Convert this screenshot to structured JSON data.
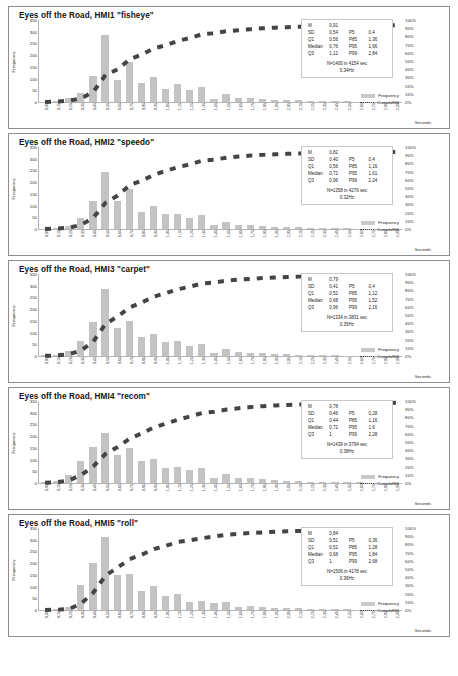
{
  "document": {
    "page_background": "#ffffff",
    "bar_color": "#c3c3c3",
    "line_color": "#444444"
  },
  "axes": {
    "y_label": "Frequency",
    "y_ticks": [
      "350",
      "300",
      "250",
      "200",
      "150",
      "100",
      "50",
      "0"
    ],
    "y_values": [
      350,
      300,
      250,
      200,
      150,
      100,
      50,
      0
    ],
    "y_max": 350,
    "y2_ticks": [
      "100%",
      "90%",
      "80%",
      "70%",
      "60%",
      "50%",
      "40%",
      "30%",
      "20%",
      "10%",
      "0%"
    ],
    "y2_values": [
      100,
      90,
      80,
      70,
      60,
      50,
      40,
      30,
      20,
      10,
      0
    ],
    "x_label": "Seconds",
    "x_ticks": [
      "0,05",
      "0,15",
      "0,25",
      "0,35",
      "0,45",
      "0,55",
      "0,65",
      "0,75",
      "0,85",
      "0,95",
      "1,05",
      "1,15",
      "1,25",
      "1,35",
      "1,45",
      "1,55",
      "1,65",
      "1,75",
      "1,85",
      "1,95",
      "2,05",
      "2,15",
      "2,25",
      "2,35",
      "2,45",
      "2,55",
      "2,65",
      "2,75",
      "2,85",
      "2,95"
    ]
  },
  "legend": {
    "frequency_label": "Frequency",
    "cumulative_label": "Cumulative"
  },
  "stat_labels": {
    "mean": "M",
    "sd": "SD",
    "q1": "Q1",
    "median": "Median",
    "q3": "Q3",
    "p5": "P5",
    "p85": "P85",
    "p95": "P95",
    "p99": "P99"
  },
  "chart_data": [
    {
      "type": "bar",
      "title": "Eyes off the Road, HMI1 \"fisheye\"",
      "xlabel": "Seconds",
      "ylabel": "Frequency",
      "ylim": [
        0,
        350
      ],
      "y2lim": [
        0,
        100
      ],
      "grid": false,
      "legend_position": "bottom-right",
      "categories": [
        "0,05",
        "0,15",
        "0,25",
        "0,35",
        "0,45",
        "0,55",
        "0,65",
        "0,75",
        "0,85",
        "0,95",
        "1,05",
        "1,15",
        "1,25",
        "1,35",
        "1,45",
        "1,55",
        "1,65",
        "1,75",
        "1,85",
        "1,95",
        "2,05",
        "2,15",
        "2,25",
        "2,35",
        "2,45",
        "2,55",
        "2,65",
        "2,75",
        "2,85",
        "2,95"
      ],
      "series": [
        {
          "name": "Frequency",
          "type": "bar",
          "values": [
            2,
            4,
            16,
            40,
            113,
            286,
            95,
            172,
            81,
            105,
            54,
            76,
            50,
            64,
            14,
            36,
            17,
            17,
            15,
            10,
            9,
            8,
            6,
            4,
            4,
            3,
            2,
            2,
            1,
            4
          ]
        },
        {
          "name": "Cumulative",
          "type": "line",
          "values": [
            0.1,
            0.5,
            1.6,
            4.5,
            12.6,
            33.0,
            39.8,
            52.1,
            57.9,
            65.4,
            69.2,
            74.7,
            78.2,
            82.8,
            83.8,
            86.4,
            87.6,
            88.8,
            89.9,
            90.6,
            91.2,
            91.8,
            92.2,
            92.5,
            92.8,
            93.0,
            93.2,
            93.3,
            93.4,
            93.7
          ]
        }
      ],
      "stats": {
        "mean": "0,91",
        "sd": "0,54",
        "q1": "0,56",
        "median": "0,76",
        "q3": "1,12",
        "p5": "0,4",
        "p85": "1,36",
        "p95": "1,96",
        "p99": "2,84"
      },
      "summary_line1": "N=1400 in 4154 sec",
      "summary_line2": "0.34Hz"
    },
    {
      "type": "bar",
      "title": "Eyes off the Road, HMI2 \"speedo\"",
      "xlabel": "Seconds",
      "ylabel": "Frequency",
      "ylim": [
        0,
        350
      ],
      "y2lim": [
        0,
        100
      ],
      "grid": false,
      "legend_position": "bottom-right",
      "categories": [
        "0,05",
        "0,15",
        "0,25",
        "0,35",
        "0,45",
        "0,55",
        "0,65",
        "0,75",
        "0,85",
        "0,95",
        "1,05",
        "1,15",
        "1,25",
        "1,35",
        "1,45",
        "1,55",
        "1,65",
        "1,75",
        "1,85",
        "1,95",
        "2,05",
        "2,15",
        "2,25",
        "2,35",
        "2,45",
        "2,55",
        "2,65",
        "2,75",
        "2,85",
        "2,95"
      ],
      "series": [
        {
          "name": "Frequency",
          "type": "bar",
          "values": [
            2,
            5,
            14,
            47,
            120,
            244,
            120,
            172,
            74,
            98,
            64,
            62,
            48,
            60,
            16,
            32,
            18,
            16,
            12,
            10,
            8,
            7,
            5,
            4,
            3,
            3,
            2,
            2,
            1,
            3
          ]
        },
        {
          "name": "Cumulative",
          "type": "line",
          "values": [
            0.1,
            0.5,
            1.6,
            5.1,
            14.0,
            32.0,
            40.8,
            53.5,
            58.9,
            66.2,
            70.9,
            75.4,
            79.0,
            83.4,
            84.6,
            87.0,
            88.3,
            89.5,
            90.4,
            91.1,
            91.7,
            92.2,
            92.6,
            92.9,
            93.1,
            93.3,
            93.4,
            93.6,
            93.6,
            93.9
          ]
        }
      ],
      "stats": {
        "mean": "0,82",
        "sd": "0,40",
        "q1": "0,56",
        "median": "0,72",
        "q3": "0,96",
        "p5": "0,4",
        "p85": "1,16",
        "p95": "1,61",
        "p99": "2,24"
      },
      "summary_line1": "N=1358 in 4276 sec",
      "summary_line2": "0.32Hz"
    },
    {
      "type": "bar",
      "title": "Eyes off the Road, HMI3 \"carpet\"",
      "xlabel": "Seconds",
      "ylabel": "Frequency",
      "ylim": [
        0,
        350
      ],
      "y2lim": [
        0,
        100
      ],
      "grid": false,
      "legend_position": "bottom-right",
      "categories": [
        "0,05",
        "0,15",
        "0,25",
        "0,35",
        "0,45",
        "0,55",
        "0,65",
        "0,75",
        "0,85",
        "0,95",
        "1,05",
        "1,15",
        "1,25",
        "1,35",
        "1,45",
        "1,55",
        "1,65",
        "1,75",
        "1,85",
        "1,95",
        "2,05",
        "2,15",
        "2,25",
        "2,35",
        "2,45",
        "2,55",
        "2,65",
        "2,75",
        "2,85",
        "2,95"
      ],
      "series": [
        {
          "name": "Frequency",
          "type": "bar",
          "values": [
            3,
            6,
            20,
            64,
            144,
            286,
            118,
            150,
            80,
            94,
            58,
            62,
            44,
            52,
            14,
            30,
            16,
            14,
            12,
            9,
            8,
            6,
            5,
            4,
            3,
            2,
            2,
            2,
            1,
            3
          ]
        },
        {
          "name": "Cumulative",
          "type": "line",
          "values": [
            0.2,
            0.7,
            2.2,
            7.0,
            17.8,
            39.2,
            48.1,
            59.3,
            65.3,
            72.4,
            76.7,
            81.4,
            84.7,
            88.6,
            89.6,
            91.9,
            93.1,
            94.1,
            95.0,
            95.7,
            96.3,
            96.8,
            97.1,
            97.4,
            97.7,
            97.8,
            98.0,
            98.1,
            98.2,
            98.4
          ]
        }
      ],
      "stats": {
        "mean": "0,79",
        "sd": "0,41",
        "q1": "0,52",
        "median": "0,68",
        "q3": "0,96",
        "p5": "0,4",
        "p85": "1,12",
        "p95": "1,52",
        "p99": "2,16"
      },
      "summary_line1": "N=1334 in 3831 sec",
      "summary_line2": "0.35Hz"
    },
    {
      "type": "bar",
      "title": "Eyes off the Road, HMI4 \"recom\"",
      "xlabel": "Seconds",
      "ylabel": "Frequency",
      "ylim": [
        0,
        350
      ],
      "y2lim": [
        0,
        100
      ],
      "grid": false,
      "legend_position": "bottom-right",
      "categories": [
        "0,05",
        "0,15",
        "0,25",
        "0,35",
        "0,45",
        "0,55",
        "0,65",
        "0,75",
        "0,85",
        "0,95",
        "1,05",
        "1,15",
        "1,25",
        "1,35",
        "1,45",
        "1,55",
        "1,65",
        "1,75",
        "1,85",
        "1,95",
        "2,05",
        "2,15",
        "2,25",
        "2,35",
        "2,45",
        "2,55",
        "2,65",
        "2,75",
        "2,85",
        "2,95"
      ],
      "series": [
        {
          "name": "Frequency",
          "type": "bar",
          "values": [
            4,
            10,
            34,
            96,
            152,
            215,
            120,
            148,
            92,
            104,
            66,
            70,
            56,
            62,
            20,
            40,
            22,
            20,
            16,
            12,
            10,
            8,
            6,
            5,
            4,
            3,
            3,
            2,
            2,
            4
          ]
        },
        {
          "name": "Cumulative",
          "type": "line",
          "values": [
            0.3,
            1.0,
            3.3,
            10.0,
            20.6,
            35.5,
            43.9,
            54.2,
            60.6,
            67.8,
            72.4,
            77.3,
            81.2,
            85.5,
            86.9,
            89.6,
            91.2,
            92.6,
            93.7,
            94.5,
            95.2,
            95.8,
            96.2,
            96.5,
            96.8,
            97.0,
            97.2,
            97.4,
            97.5,
            97.8
          ]
        }
      ],
      "stats": {
        "mean": "0,78",
        "sd": "0,46",
        "q1": "0,44",
        "median": "0,72",
        "q3": "1",
        "p5": "0,28",
        "p85": "1,16",
        "p95": "1,6",
        "p99": "2,28"
      },
      "summary_line1": "N=1439 in 3794 sec",
      "summary_line2": "0.38Hz"
    },
    {
      "type": "bar",
      "title": "Eyes off the Road, HMI5 \"roll\"",
      "xlabel": "Seconds",
      "ylabel": "Frequency",
      "ylim": [
        0,
        350
      ],
      "y2lim": [
        0,
        100
      ],
      "grid": false,
      "legend_position": "bottom-right",
      "categories": [
        "0,05",
        "0,15",
        "0,25",
        "0,35",
        "0,45",
        "0,55",
        "0,65",
        "0,75",
        "0,85",
        "0,95",
        "1,05",
        "1,15",
        "1,25",
        "1,35",
        "1,45",
        "1,55",
        "1,65",
        "1,75",
        "1,85",
        "1,95",
        "2,05",
        "2,15",
        "2,25",
        "2,35",
        "2,45",
        "2,55",
        "2,65",
        "2,75",
        "2,85",
        "2,95"
      ],
      "series": [
        {
          "name": "Frequency",
          "type": "bar",
          "values": [
            2,
            4,
            12,
            105,
            200,
            310,
            148,
            155,
            81,
            103,
            61,
            69,
            33,
            37,
            30,
            34,
            15,
            16,
            12,
            10,
            8,
            7,
            5,
            4,
            3,
            3,
            2,
            2,
            1,
            3
          ]
        },
        {
          "name": "Cumulative",
          "type": "line",
          "values": [
            0.1,
            0.4,
            1.2,
            8.1,
            21.4,
            42.0,
            51.8,
            62.1,
            67.5,
            74.3,
            78.4,
            83.0,
            85.2,
            87.6,
            89.6,
            91.9,
            92.9,
            93.9,
            94.7,
            95.4,
            95.9,
            96.4,
            96.7,
            97.0,
            97.2,
            97.4,
            97.5,
            97.6,
            97.7,
            97.9
          ]
        }
      ],
      "stats": {
        "mean": "0,84",
        "sd": "0,51",
        "q1": "0,52",
        "median": "0,68",
        "q3": "1",
        "p5": "0,36",
        "p85": "1,28",
        "p95": "1,84",
        "p99": "2,68"
      },
      "summary_line1": "N=1506 in 4178 sec",
      "summary_line2": "0.36Hz"
    }
  ]
}
